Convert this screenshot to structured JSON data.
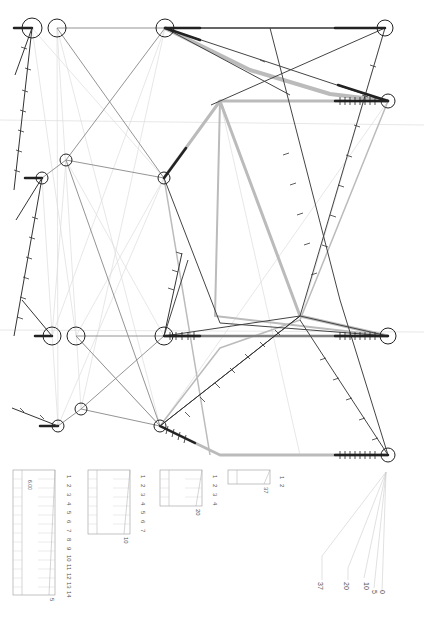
{
  "diagram": {
    "title": "",
    "orientation": "rotated-90",
    "nodes": [
      {
        "id": "n1",
        "x": 32,
        "y": 28,
        "r": 10
      },
      {
        "id": "n2",
        "x": 57,
        "y": 28,
        "r": 9
      },
      {
        "id": "n3",
        "x": 165,
        "y": 28,
        "r": 9
      },
      {
        "id": "n4",
        "x": 385,
        "y": 28,
        "r": 8
      },
      {
        "id": "n5",
        "x": 388,
        "y": 101,
        "r": 7
      },
      {
        "id": "n6",
        "x": 66,
        "y": 160,
        "r": 6
      },
      {
        "id": "n7",
        "x": 42,
        "y": 178,
        "r": 6
      },
      {
        "id": "n8",
        "x": 164,
        "y": 178,
        "r": 6
      },
      {
        "id": "n9",
        "x": 52,
        "y": 336,
        "r": 9
      },
      {
        "id": "n10",
        "x": 76,
        "y": 336,
        "r": 9
      },
      {
        "id": "n11",
        "x": 164,
        "y": 336,
        "r": 9
      },
      {
        "id": "n12",
        "x": 388,
        "y": 336,
        "r": 8
      },
      {
        "id": "n13",
        "x": 81,
        "y": 409,
        "r": 6
      },
      {
        "id": "n14",
        "x": 58,
        "y": 426,
        "r": 6
      },
      {
        "id": "n15",
        "x": 160,
        "y": 426,
        "r": 6
      },
      {
        "id": "n16",
        "x": 388,
        "y": 455,
        "r": 7
      }
    ],
    "legends": [
      {
        "id": "legend-1",
        "scale_label": "5",
        "ticks": [
          "14",
          "13",
          "12",
          "11",
          "10",
          "9",
          "8",
          "7",
          "6",
          "5",
          "4",
          "3",
          "2",
          "1"
        ],
        "note": "6.00"
      },
      {
        "id": "legend-2",
        "scale_label": "10",
        "ticks": [
          "7",
          "6",
          "5",
          "4",
          "3",
          "2",
          "1"
        ]
      },
      {
        "id": "legend-3",
        "scale_label": "20",
        "ticks": [
          "4",
          "3",
          "2",
          "1"
        ]
      },
      {
        "id": "legend-4",
        "scale_label": "37",
        "ticks": [
          "2",
          "1"
        ]
      }
    ],
    "width_key": {
      "labels": [
        "37",
        "20",
        "10",
        "5",
        "0"
      ]
    },
    "colors": {
      "line_dark": "#333333",
      "line_mid": "#777777",
      "line_light": "#cccccc",
      "band_gray": "#bbbbbb",
      "node_stroke": "#222222"
    }
  }
}
